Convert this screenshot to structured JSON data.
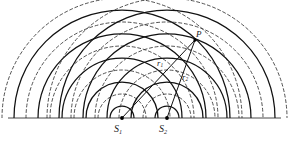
{
  "figure": {
    "canvas": {
      "width": 289,
      "height": 141,
      "background": "#ffffff"
    },
    "baseline": {
      "y": 118,
      "x_start": 8,
      "x_end": 281,
      "color": "#1a1a1a",
      "width": 0.8
    }
  },
  "style": {
    "crest_color": "#111111",
    "trough_color": "#333333",
    "ray_color": "#111111",
    "crest_width": 1.25,
    "trough_width": 0.85,
    "trough_dash": "3,2.6",
    "source_dot_color": "#000000",
    "source_dot_radius": 1.9
  },
  "sources": [
    {
      "id": "S1",
      "label": "S",
      "sub": "1",
      "x": 122,
      "y": 118,
      "label_x": 114,
      "label_y": 124
    },
    {
      "id": "S2",
      "label": "S",
      "sub": "2",
      "x": 167,
      "y": 118,
      "label_x": 159,
      "label_y": 124
    }
  ],
  "point_p": {
    "id": "P",
    "label": "P",
    "x": 195,
    "y": 40,
    "label_x": 196,
    "label_y": 30
  },
  "rays": [
    {
      "id": "r1",
      "from": "S1",
      "to": "P",
      "label": "r",
      "sub": "1",
      "label_x": 157,
      "label_y": 59
    },
    {
      "id": "r2",
      "from": "S2",
      "to": "P",
      "label": "r",
      "sub": "2",
      "label_x": 182,
      "label_y": 73
    }
  ],
  "wavefronts": {
    "description": "Concentric semicircular wavefronts emitted from each source; solid = crest, dashed = trough",
    "radius_start": 12,
    "radius_step": 12,
    "count_per_source": 10,
    "radii": [
      12,
      24,
      36,
      48,
      60,
      72,
      84,
      96,
      108,
      120
    ],
    "kinds": [
      "crest",
      "trough",
      "crest",
      "trough",
      "crest",
      "trough",
      "crest",
      "trough",
      "crest",
      "trough"
    ]
  },
  "labels": {
    "s1_text": "S",
    "s1_sub": "1",
    "s2_text": "S",
    "s2_sub": "2",
    "p_text": "P",
    "r1_text": "r",
    "r1_sub": "1",
    "r2_text": "r",
    "r2_sub": "2"
  }
}
